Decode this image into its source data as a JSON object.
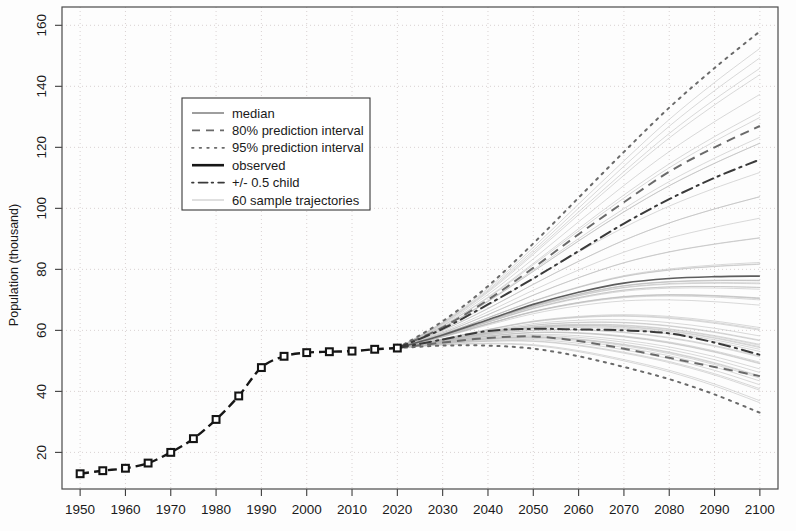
{
  "chart_data": {
    "type": "line",
    "title": "",
    "xlabel": "",
    "ylabel": "Population (thousand)",
    "xlim": [
      1946,
      2104
    ],
    "ylim": [
      8,
      166
    ],
    "xticks": [
      1950,
      1960,
      1970,
      1980,
      1990,
      2000,
      2010,
      2020,
      2030,
      2040,
      2050,
      2060,
      2070,
      2080,
      2090,
      2100
    ],
    "yticks": [
      20,
      40,
      60,
      80,
      100,
      120,
      140,
      160
    ],
    "grid": true,
    "legend_position": "upper-left-inside",
    "legend": [
      {
        "label": "median",
        "style": "solid-thin",
        "color": "#5d5d5d"
      },
      {
        "label": "80% prediction interval",
        "style": "dashed",
        "color": "#6a6a6a"
      },
      {
        "label": "95% prediction interval",
        "style": "dotted",
        "color": "#6a6a6a"
      },
      {
        "label": "observed",
        "style": "solid-thick",
        "color": "#171717"
      },
      {
        "label": "+/- 0.5 child",
        "style": "dash-dot",
        "color": "#3a3a3a"
      },
      {
        "label": "60 sample trajectories",
        "style": "solid-light",
        "color": "#b9b9b9"
      }
    ],
    "series": [
      {
        "name": "observed",
        "style": "observed",
        "x": [
          1950,
          1955,
          1960,
          1965,
          1970,
          1975,
          1980,
          1985,
          1990,
          1995,
          2000,
          2005,
          2010,
          2015,
          2020
        ],
        "values": [
          13.0,
          14.0,
          14.8,
          16.5,
          20.0,
          24.5,
          30.8,
          38.5,
          47.8,
          51.5,
          52.7,
          53.0,
          53.2,
          53.8,
          54.2
        ]
      },
      {
        "name": "median",
        "style": "median",
        "x": [
          2020,
          2030,
          2040,
          2050,
          2060,
          2070,
          2080,
          2090,
          2100
        ],
        "values": [
          54.2,
          58.5,
          63.5,
          68.5,
          72.5,
          75.5,
          77.0,
          77.6,
          77.8
        ]
      },
      {
        "name": "80% prediction interval upper",
        "style": "pi80",
        "x": [
          2020,
          2030,
          2040,
          2050,
          2060,
          2070,
          2080,
          2090,
          2100
        ],
        "values": [
          54.2,
          61.0,
          70.0,
          80.5,
          91.5,
          102.0,
          112.0,
          120.0,
          127.0
        ]
      },
      {
        "name": "80% prediction interval lower",
        "style": "pi80",
        "x": [
          2020,
          2030,
          2040,
          2050,
          2060,
          2070,
          2080,
          2090,
          2100
        ],
        "values": [
          54.2,
          56.0,
          57.5,
          58.0,
          56.5,
          54.0,
          51.0,
          48.0,
          45.0
        ]
      },
      {
        "name": "95% prediction interval upper",
        "style": "pi95",
        "x": [
          2020,
          2030,
          2040,
          2050,
          2060,
          2070,
          2080,
          2090,
          2100
        ],
        "values": [
          54.2,
          63.0,
          74.5,
          88.5,
          103.5,
          118.5,
          133.0,
          146.0,
          158.0
        ]
      },
      {
        "name": "95% prediction interval lower",
        "style": "pi95",
        "x": [
          2020,
          2030,
          2040,
          2050,
          2060,
          2070,
          2080,
          2090,
          2100
        ],
        "values": [
          54.2,
          55.0,
          55.0,
          54.0,
          51.5,
          48.0,
          44.0,
          39.0,
          33.0
        ]
      },
      {
        "name": "+/- 0.5 child high",
        "style": "halfchild",
        "x": [
          2020,
          2030,
          2040,
          2050,
          2060,
          2070,
          2080,
          2090,
          2100
        ],
        "values": [
          54.2,
          60.5,
          68.5,
          77.0,
          86.0,
          95.0,
          103.0,
          110.0,
          116.0
        ]
      },
      {
        "name": "+/- 0.5 child low",
        "style": "halfchild",
        "x": [
          2020,
          2030,
          2040,
          2050,
          2060,
          2070,
          2080,
          2090,
          2100
        ],
        "values": [
          54.2,
          57.0,
          59.8,
          60.5,
          60.3,
          60.0,
          59.0,
          56.0,
          52.0
        ]
      }
    ],
    "sample_trajectories_count": 60
  },
  "axes": {
    "ylabel": "Population (thousand)",
    "xtick_labels": [
      "1950",
      "1960",
      "1970",
      "1980",
      "1990",
      "2000",
      "2010",
      "2020",
      "2030",
      "2040",
      "2050",
      "2060",
      "2070",
      "2080",
      "2090",
      "2100"
    ],
    "ytick_labels": [
      "20",
      "40",
      "60",
      "80",
      "100",
      "120",
      "140",
      "160"
    ]
  },
  "legend": {
    "items": [
      "median",
      "80% prediction interval",
      "95% prediction interval",
      "observed",
      "+/- 0.5 child",
      "60 sample trajectories"
    ]
  }
}
